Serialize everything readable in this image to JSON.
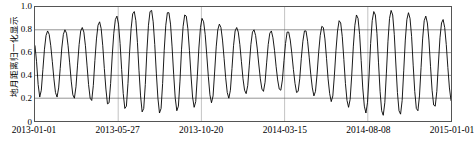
{
  "chart_data": {
    "type": "line",
    "title": "",
    "xlabel": "",
    "ylabel": "地月距离归一化显示",
    "ylim": [
      0,
      1.0
    ],
    "yticks": [
      "0",
      "0.2",
      "0.4",
      "0.6",
      "0.8",
      "1.0"
    ],
    "ytick_values": [
      0,
      0.2,
      0.4,
      0.6,
      0.8,
      1.0
    ],
    "xticks": [
      "2013-01-01",
      "2013-05-27",
      "2013-10-20",
      "2014-03-15",
      "2014-08-08",
      "2015-01-01"
    ],
    "xtick_positions": [
      0,
      0.2,
      0.4,
      0.6,
      0.8,
      1.0
    ],
    "grid": "horizontal-and-vertical",
    "legend": "none",
    "series": [
      {
        "name": "地月距离归一化",
        "color": "#000000",
        "description": "周期约27.55天的地月距离归一化振荡，带有包络调制（拍频）",
        "cycles": 26,
        "period_days": 27.55,
        "envelope_note": "峰值在0.78~0.98之间变化，谷值在0.05~0.27之间变化",
        "values": [
          0.66,
          0.52,
          0.32,
          0.21,
          0.27,
          0.45,
          0.63,
          0.75,
          0.79,
          0.76,
          0.66,
          0.52,
          0.37,
          0.25,
          0.21,
          0.29,
          0.46,
          0.64,
          0.76,
          0.8,
          0.77,
          0.66,
          0.51,
          0.35,
          0.23,
          0.2,
          0.3,
          0.49,
          0.67,
          0.79,
          0.82,
          0.78,
          0.66,
          0.49,
          0.32,
          0.2,
          0.18,
          0.31,
          0.53,
          0.72,
          0.84,
          0.87,
          0.81,
          0.66,
          0.46,
          0.28,
          0.15,
          0.16,
          0.33,
          0.57,
          0.77,
          0.89,
          0.92,
          0.85,
          0.68,
          0.45,
          0.24,
          0.11,
          0.13,
          0.33,
          0.6,
          0.81,
          0.94,
          0.96,
          0.88,
          0.69,
          0.44,
          0.22,
          0.08,
          0.11,
          0.32,
          0.61,
          0.84,
          0.96,
          0.97,
          0.87,
          0.67,
          0.42,
          0.2,
          0.07,
          0.11,
          0.33,
          0.62,
          0.84,
          0.95,
          0.95,
          0.85,
          0.65,
          0.41,
          0.2,
          0.09,
          0.13,
          0.35,
          0.63,
          0.83,
          0.93,
          0.92,
          0.81,
          0.62,
          0.4,
          0.21,
          0.12,
          0.17,
          0.39,
          0.64,
          0.82,
          0.9,
          0.87,
          0.76,
          0.58,
          0.39,
          0.23,
          0.16,
          0.22,
          0.43,
          0.65,
          0.8,
          0.85,
          0.82,
          0.71,
          0.55,
          0.38,
          0.25,
          0.2,
          0.27,
          0.46,
          0.66,
          0.79,
          0.82,
          0.78,
          0.67,
          0.52,
          0.37,
          0.27,
          0.24,
          0.31,
          0.49,
          0.67,
          0.78,
          0.8,
          0.75,
          0.64,
          0.5,
          0.37,
          0.28,
          0.26,
          0.34,
          0.51,
          0.67,
          0.77,
          0.79,
          0.73,
          0.62,
          0.48,
          0.36,
          0.28,
          0.27,
          0.36,
          0.53,
          0.68,
          0.78,
          0.78,
          0.71,
          0.59,
          0.45,
          0.33,
          0.25,
          0.26,
          0.37,
          0.55,
          0.7,
          0.79,
          0.79,
          0.7,
          0.56,
          0.41,
          0.29,
          0.22,
          0.26,
          0.41,
          0.6,
          0.75,
          0.83,
          0.82,
          0.72,
          0.55,
          0.37,
          0.24,
          0.17,
          0.22,
          0.4,
          0.62,
          0.79,
          0.88,
          0.86,
          0.74,
          0.54,
          0.33,
          0.18,
          0.12,
          0.19,
          0.4,
          0.65,
          0.84,
          0.93,
          0.9,
          0.76,
          0.53,
          0.29,
          0.13,
          0.07,
          0.16,
          0.4,
          0.68,
          0.88,
          0.96,
          0.93,
          0.77,
          0.51,
          0.26,
          0.09,
          0.05,
          0.16,
          0.42,
          0.7,
          0.9,
          0.97,
          0.93,
          0.76,
          0.5,
          0.25,
          0.09,
          0.06,
          0.18,
          0.44,
          0.71,
          0.89,
          0.95,
          0.9,
          0.74,
          0.49,
          0.26,
          0.11,
          0.09,
          0.22,
          0.47,
          0.72,
          0.88,
          0.92,
          0.86,
          0.71,
          0.48,
          0.27,
          0.14,
          0.13,
          0.26,
          0.5,
          0.73,
          0.86,
          0.89,
          0.82,
          0.67,
          0.47,
          0.29,
          0.18
        ]
      }
    ]
  }
}
